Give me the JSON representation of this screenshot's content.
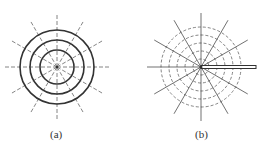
{
  "figures": [
    {
      "id": "a",
      "caption": "(a)",
      "description": "Three concentric solid circles with twelve dashed radial lines",
      "center": [
        57,
        67
      ],
      "solid_circle_radii": [
        17,
        27,
        37
      ],
      "radial_line_count": 12,
      "radial_line_length": 52,
      "radial_style": "dashed"
    },
    {
      "id": "b",
      "caption": "(b)",
      "description": "Concentric dashed circles with twelve solid radial lines and a thick horizontal bar from the center to the right",
      "center": [
        201,
        67
      ],
      "dashed_circle_radii": [
        8,
        16,
        24,
        32,
        40
      ],
      "radial_line_count": 12,
      "radial_line_length": 54,
      "radial_style": "solid",
      "bar": {
        "from_x": 201,
        "to_x": 256,
        "y": 67,
        "thickness": 3
      }
    }
  ],
  "colors": {
    "line": "#333333",
    "dash": "#666666",
    "background": "#ffffff"
  }
}
